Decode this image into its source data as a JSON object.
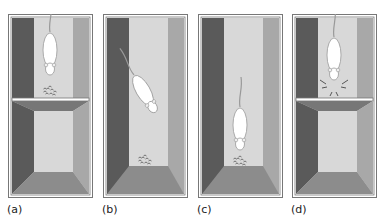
{
  "figure": {
    "panels": [
      {
        "id": "a",
        "label": "(a)",
        "rat_position": "on-platform",
        "food_position": "on-platform-edge",
        "platform": true
      },
      {
        "id": "b",
        "label": "(b)",
        "rat_position": "descending",
        "food_position": "floor",
        "platform": false
      },
      {
        "id": "c",
        "label": "(c)",
        "rat_position": "at-food",
        "food_position": "floor",
        "platform": false
      },
      {
        "id": "d",
        "label": "(d)",
        "rat_position": "on-platform-sniffing",
        "food_position": "none",
        "platform": true
      }
    ],
    "colors": {
      "left_wall": "#5a5a5a",
      "back_wall": "#d8d8d8",
      "right_wall": "#a8a8a8",
      "floor": "#8c8c8c",
      "frame": "#777777",
      "rat": "#ffffff",
      "food": "#666666"
    }
  }
}
